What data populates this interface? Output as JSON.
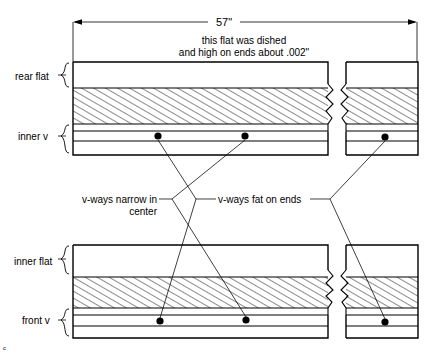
{
  "diagram": {
    "title_note": {
      "line1": "this flat was dished",
      "line2": "and high on ends about .002\""
    },
    "dimension": {
      "label": "57\"",
      "extent_description": "overall length"
    },
    "labels": {
      "rear_flat": "rear flat",
      "inner_v_top": "inner v",
      "inner_flat": "inner flat",
      "front_v": "front v"
    },
    "callouts": {
      "narrow_center_line1": "v-ways narrow in",
      "narrow_center_line2": "center",
      "fat_on_ends": "v-ways fat on ends"
    },
    "colors": {
      "ink": "#000000",
      "paper": "#ffffff"
    },
    "measure_points": [
      {
        "name": "rear-v-center-left",
        "x": 158,
        "y": 136
      },
      {
        "name": "rear-v-center-right",
        "x": 245,
        "y": 136
      },
      {
        "name": "rear-v-end-right",
        "x": 385,
        "y": 137
      },
      {
        "name": "front-v-center-left",
        "x": 160,
        "y": 321
      },
      {
        "name": "front-v-center-right",
        "x": 246,
        "y": 320
      },
      {
        "name": "front-v-end-right",
        "x": 385,
        "y": 322
      }
    ]
  }
}
